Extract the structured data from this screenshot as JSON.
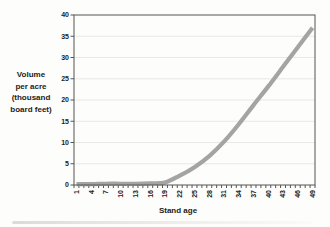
{
  "chart_data": {
    "type": "line",
    "title": "",
    "xlabel": "Stand age",
    "ylabel": "Volume per acre (thousand board feet)",
    "ylabel_lines": [
      "Volume",
      "per acre",
      "(thousand",
      "board feet)"
    ],
    "x": [
      1,
      4,
      7,
      10,
      13,
      16,
      19,
      22,
      25,
      28,
      31,
      34,
      37,
      40,
      43,
      46,
      49
    ],
    "values": [
      0.2,
      0.2,
      0.3,
      0.3,
      0.3,
      0.4,
      0.6,
      2.2,
      4.2,
      6.8,
      10.2,
      14.3,
      18.8,
      23.2,
      27.8,
      32.4,
      37
    ],
    "xlim": [
      1,
      49
    ],
    "ylim": [
      0,
      40
    ],
    "ytick_step": 5,
    "grid": true,
    "legend": "none",
    "line_color": "#a4a4a2",
    "axis_color": "#555555",
    "grid_color": "#e8e8e4",
    "text_color": "#1b1b1b"
  }
}
